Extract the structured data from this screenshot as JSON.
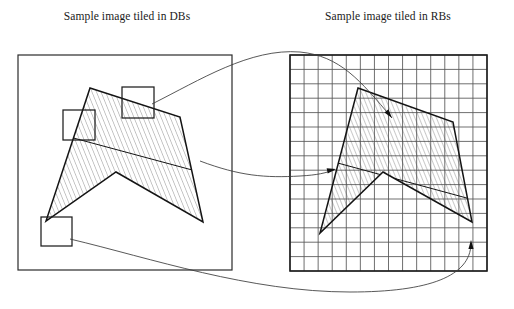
{
  "figure": {
    "panels": [
      {
        "id": "left-panel",
        "caption": "Sample image tiled in DBs",
        "caption_x": 127,
        "caption_y": 20,
        "frame": {
          "x": 18,
          "y": 55,
          "width": 214,
          "height": 215
        },
        "tiling": "irregular-blocks",
        "polygon_points": "90,88 180,117 203,222 116,172 46,221",
        "chord": "66,136 207,174",
        "tile_boxes": [
          {
            "name": "tile-box-top",
            "x": 122,
            "y": 87,
            "width": 32,
            "height": 31
          },
          {
            "name": "tile-box-left",
            "x": 63,
            "y": 110,
            "width": 32,
            "height": 30
          },
          {
            "name": "tile-box-bottom-left",
            "x": 41,
            "y": 217,
            "width": 31,
            "height": 29
          }
        ]
      },
      {
        "id": "right-panel",
        "caption": "Sample image tiled in RBs",
        "caption_x": 388,
        "caption_y": 20,
        "frame": {
          "x": 290,
          "y": 55,
          "width": 197,
          "height": 216
        },
        "tiling": "regular-grid",
        "grid": {
          "columns": 14,
          "rows": 15,
          "cell_width": 14.07,
          "cell_height": 14.4
        },
        "polygon_points": "358,88 453,122 472,222 383,172 320,233",
        "chord": "334,162 474,200"
      }
    ],
    "connectors": [
      {
        "name": "connector-top-tile",
        "path": "M 152,104 C 200,80 250,48 300,52 C 340,56 360,80 392,118",
        "has_arrow": true,
        "arrow_at": [
          392,
          118
        ],
        "arrow_angle": 52
      },
      {
        "name": "connector-middle-tile",
        "path": "M 200,161 C 240,176 265,178 300,176 C 318,175 325,173 334,170",
        "has_arrow": true,
        "arrow_at": [
          336,
          169
        ],
        "arrow_angle": -12
      },
      {
        "name": "connector-bottom-tile",
        "path": "M 70,239 C 150,258 250,292 350,292 C 430,292 470,276 471,244",
        "has_arrow": true,
        "arrow_at": [
          471,
          240
        ],
        "arrow_angle": -90
      }
    ]
  }
}
